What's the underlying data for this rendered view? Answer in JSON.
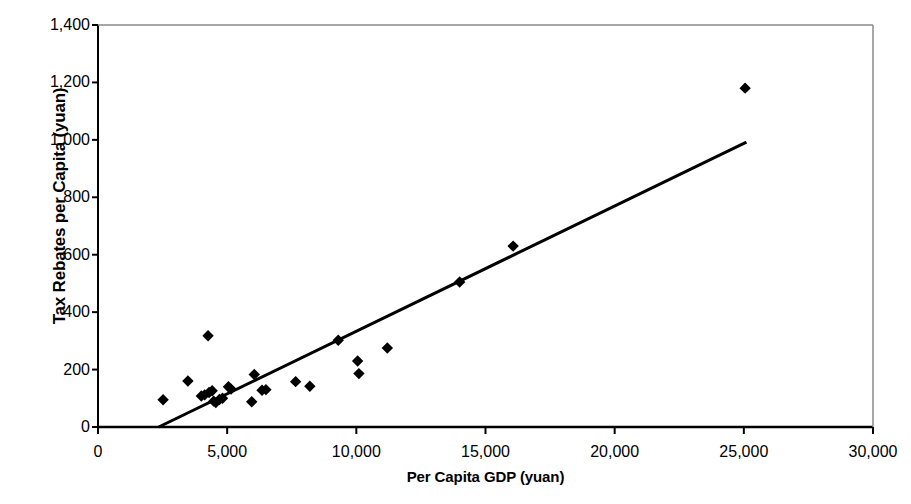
{
  "chart_data": {
    "type": "scatter",
    "title": "",
    "xlabel": "Per Capita GDP (yuan)",
    "ylabel": "Tax Rebates per Capita (yuan)",
    "xlim": [
      0,
      30000
    ],
    "ylim": [
      0,
      1400
    ],
    "xticks": [
      0,
      5000,
      10000,
      15000,
      20000,
      25000,
      30000
    ],
    "yticks": [
      0,
      200,
      400,
      600,
      800,
      1000,
      1200,
      1400
    ],
    "xtick_labels": [
      "0",
      "5,000",
      "10,000",
      "15,000",
      "20,000",
      "25,000",
      "30,000"
    ],
    "ytick_labels": [
      "0",
      "200",
      "400",
      "600",
      "800",
      "1,000",
      "1,200",
      "1,400"
    ],
    "grid": false,
    "legend": false,
    "legend_position": "none",
    "marker": "diamond",
    "marker_color": "#000000",
    "marker_size": 9,
    "series": [
      {
        "name": "Provinces",
        "points": [
          {
            "x": 2520,
            "y": 95
          },
          {
            "x": 3480,
            "y": 160
          },
          {
            "x": 4000,
            "y": 108
          },
          {
            "x": 4130,
            "y": 112
          },
          {
            "x": 4260,
            "y": 318
          },
          {
            "x": 4300,
            "y": 120
          },
          {
            "x": 4420,
            "y": 126
          },
          {
            "x": 4480,
            "y": 90
          },
          {
            "x": 4560,
            "y": 85
          },
          {
            "x": 4700,
            "y": 96
          },
          {
            "x": 4820,
            "y": 100
          },
          {
            "x": 5050,
            "y": 140
          },
          {
            "x": 5150,
            "y": 132
          },
          {
            "x": 5950,
            "y": 88
          },
          {
            "x": 6050,
            "y": 183
          },
          {
            "x": 6350,
            "y": 128
          },
          {
            "x": 6500,
            "y": 130
          },
          {
            "x": 7650,
            "y": 158
          },
          {
            "x": 8200,
            "y": 142
          },
          {
            "x": 9300,
            "y": 302
          },
          {
            "x": 10050,
            "y": 230
          },
          {
            "x": 10100,
            "y": 186
          },
          {
            "x": 11200,
            "y": 275
          },
          {
            "x": 14000,
            "y": 505
          },
          {
            "x": 16070,
            "y": 630
          },
          {
            "x": 25050,
            "y": 1180
          }
        ]
      }
    ],
    "trendline": {
      "name": "linear fit",
      "color": "#000000",
      "width": 3,
      "x_start": 2350,
      "y_start": 0,
      "x_end": 25100,
      "y_end": 992
    }
  }
}
